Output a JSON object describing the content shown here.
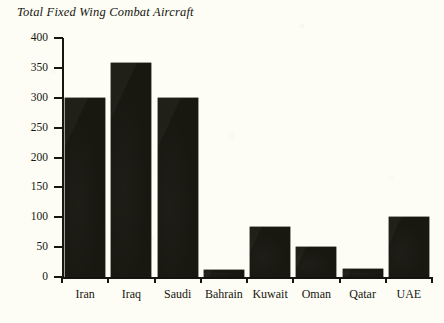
{
  "figure": {
    "title": "Total Fixed Wing Combat Aircraft",
    "background_color": "#fdfdf5",
    "ink_color": "#181811"
  },
  "chart_data": {
    "type": "bar",
    "title": "Total Fixed Wing Combat Aircraft",
    "xlabel": "",
    "ylabel": "",
    "ylim": [
      0,
      400
    ],
    "ytick_step": 50,
    "grid": false,
    "legend": false,
    "categories": [
      "Iran",
      "Iraq",
      "Saudi",
      "Bahrain",
      "Kuwait",
      "Oman",
      "Qatar",
      "UAE"
    ],
    "values": [
      300,
      358,
      300,
      12,
      83,
      50,
      14,
      100
    ],
    "ytick_labels": [
      "0",
      "50",
      "100",
      "150",
      "200",
      "250",
      "300",
      "350",
      "400"
    ],
    "bar_color": "#181811"
  }
}
